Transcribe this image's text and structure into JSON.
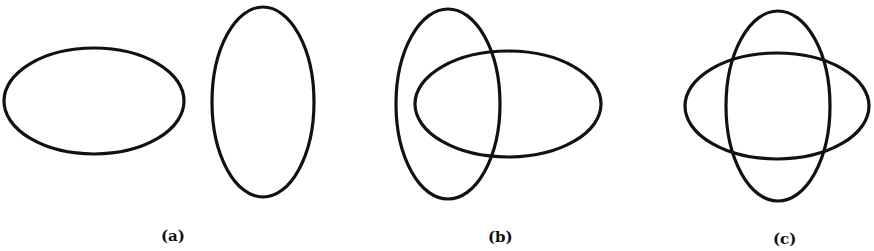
{
  "figure": {
    "stroke_color": "#111111",
    "background": "#ffffff",
    "panels": [
      {
        "label": "(a)",
        "description": "two separate ellipses, one horizontal and one vertical, not touching",
        "ellipses": [
          {
            "orientation": "horizontal",
            "cx": 94,
            "cy": 101,
            "rx": 90,
            "ry": 53
          },
          {
            "orientation": "vertical",
            "cx": 263,
            "cy": 102,
            "rx": 51,
            "ry": 95
          }
        ]
      },
      {
        "label": "(b)",
        "description": "vertical ellipse partially overlapping horizontal ellipse",
        "ellipses": [
          {
            "orientation": "vertical",
            "cx": 448,
            "cy": 104,
            "rx": 52,
            "ry": 95
          },
          {
            "orientation": "horizontal",
            "cx": 508,
            "cy": 104,
            "rx": 93,
            "ry": 53
          }
        ]
      },
      {
        "label": "(c)",
        "description": "vertical and horizontal ellipses concentric, crossing at four points",
        "ellipses": [
          {
            "orientation": "vertical",
            "cx": 778,
            "cy": 106,
            "rx": 52,
            "ry": 95
          },
          {
            "orientation": "horizontal",
            "cx": 777,
            "cy": 106,
            "rx": 92,
            "ry": 53
          }
        ]
      }
    ]
  }
}
